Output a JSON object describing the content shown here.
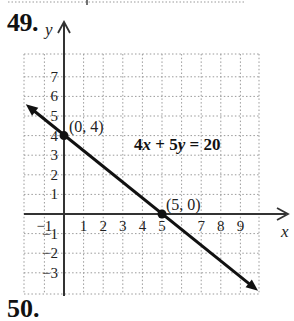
{
  "problem": {
    "number": "49.",
    "next_number": "50."
  },
  "chart_data": {
    "type": "line",
    "title": "",
    "equation": "4x + 5y = 20",
    "xlabel": "x",
    "ylabel": "y",
    "xlim": [
      -2,
      10
    ],
    "ylim": [
      -4,
      8
    ],
    "grid": true,
    "grid_style": "dotted",
    "x_ticks": [
      "−1",
      "1",
      "2",
      "3",
      "4",
      "5",
      "7",
      "8",
      "9"
    ],
    "x_tick_values": [
      -1,
      1,
      2,
      3,
      4,
      5,
      7,
      8,
      9
    ],
    "y_ticks": [
      "7",
      "6",
      "5",
      "4",
      "3",
      "2",
      "1",
      "−1",
      "−2",
      "−3"
    ],
    "y_tick_values": [
      7,
      6,
      5,
      4,
      3,
      2,
      1,
      -1,
      -2,
      -3
    ],
    "series": [
      {
        "name": "4x + 5y = 20",
        "slope": -0.8,
        "intercept": 4,
        "x": [
          -2,
          9.9
        ],
        "y": [
          5.6,
          -3.92
        ],
        "arrows": "both"
      }
    ],
    "points": [
      {
        "x": 0,
        "y": 4,
        "label": "(0, 4)"
      },
      {
        "x": 5,
        "y": 0,
        "label": "(5, 0)"
      }
    ]
  }
}
